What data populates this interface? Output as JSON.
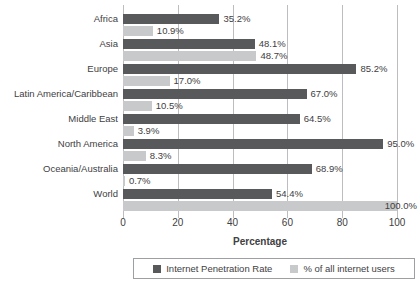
{
  "chart_data": {
    "type": "bar",
    "orientation": "horizontal",
    "xlabel": "Percentage",
    "xlim": [
      0,
      100
    ],
    "xticks": [
      "0",
      "20",
      "40",
      "60",
      "80",
      "100"
    ],
    "grid": "vertical",
    "legend_position": "bottom",
    "categories": [
      "Africa",
      "Asia",
      "Europe",
      "Latin America/Caribbean",
      "Middle East",
      "North America",
      "Oceania/Australia",
      "World"
    ],
    "series": [
      {
        "name": "Internet Penetration Rate",
        "color": "#58595b",
        "values": [
          35.2,
          48.1,
          85.2,
          67.0,
          64.5,
          95.0,
          68.9,
          54.4
        ],
        "labels": [
          "35.2%",
          "48.1%",
          "85.2%",
          "67.0%",
          "64.5%",
          "95.0%",
          "68.9%",
          "54.4%"
        ]
      },
      {
        "name": "% of all internet users",
        "color": "#c8c9ca",
        "values": [
          10.9,
          48.7,
          17.0,
          10.5,
          3.9,
          8.3,
          0.7,
          100.0
        ],
        "labels": [
          "10.9%",
          "48.7%",
          "17.0%",
          "10.5%",
          "3.9%",
          "8.3%",
          "0.7%",
          "100.0%"
        ],
        "overlap_label_indices": [
          7
        ]
      }
    ]
  },
  "legend": {
    "items": [
      {
        "label": "Internet Penetration Rate",
        "color": "#58595b"
      },
      {
        "label": "% of all internet users",
        "color": "#c8c9ca"
      }
    ]
  },
  "colors": {
    "background": "#ffffff",
    "bar_dark": "#58595b",
    "bar_light": "#c8c9ca",
    "text": "#414042",
    "gridline": "#bdbdbf",
    "legend_border": "#9d9fa2"
  }
}
